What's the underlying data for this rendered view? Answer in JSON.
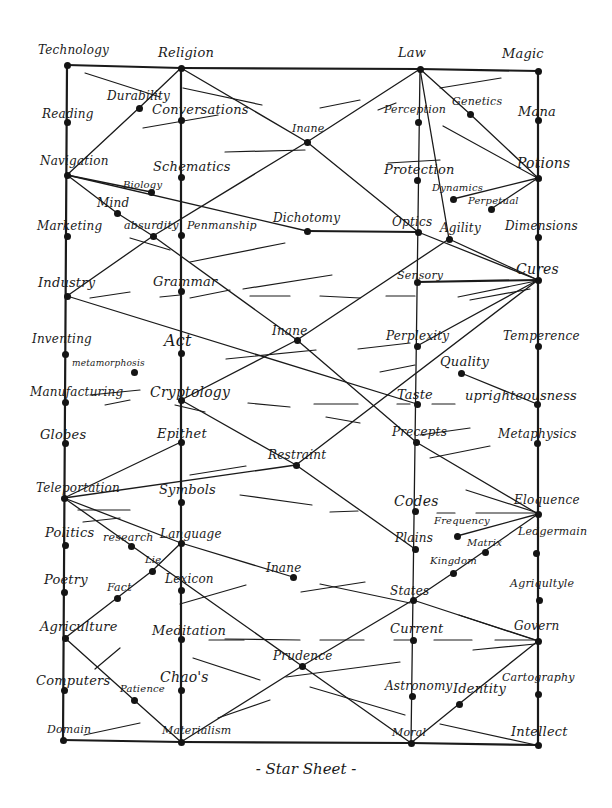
{
  "title": "- Star Sheet -",
  "colors": {
    "ink": "#1a1a1a",
    "paper": "#ffffff"
  },
  "columns": [
    {
      "id": "technology",
      "x": 67
    },
    {
      "id": "religion",
      "x": 181
    },
    {
      "id": "law",
      "x": 420
    },
    {
      "id": "magic",
      "x": 540
    }
  ],
  "nodes": [
    {
      "id": "technology",
      "label": "Technology",
      "x": 67,
      "y": 65,
      "lx": 38,
      "ly": 44,
      "fs": 12
    },
    {
      "id": "reading",
      "label": "Reading",
      "x": 67,
      "y": 122,
      "lx": 42,
      "ly": 108,
      "fs": 12
    },
    {
      "id": "navigation",
      "label": "Navigation",
      "x": 67,
      "y": 175,
      "lx": 40,
      "ly": 155,
      "fs": 12
    },
    {
      "id": "marketing",
      "label": "Marketing",
      "x": 67,
      "y": 236,
      "lx": 37,
      "ly": 220,
      "fs": 12
    },
    {
      "id": "industry",
      "label": "Industry",
      "x": 67,
      "y": 296,
      "lx": 38,
      "ly": 276,
      "fs": 13
    },
    {
      "id": "inventing",
      "label": "Inventing",
      "x": 65,
      "y": 354,
      "lx": 32,
      "ly": 333,
      "fs": 12
    },
    {
      "id": "manufacturing",
      "label": "Manufacturing",
      "x": 65,
      "y": 402,
      "lx": 30,
      "ly": 386,
      "fs": 12
    },
    {
      "id": "globes",
      "label": "Globes",
      "x": 65,
      "y": 443,
      "lx": 40,
      "ly": 428,
      "fs": 13
    },
    {
      "id": "teleportation",
      "label": "Teleportation",
      "x": 64,
      "y": 498,
      "lx": 36,
      "ly": 482,
      "fs": 12
    },
    {
      "id": "politics",
      "label": "Politics",
      "x": 65,
      "y": 545,
      "lx": 45,
      "ly": 526,
      "fs": 13
    },
    {
      "id": "poetry",
      "label": "Poetry",
      "x": 64,
      "y": 592,
      "lx": 44,
      "ly": 573,
      "fs": 13
    },
    {
      "id": "agriculture-left",
      "label": "Agriculture",
      "x": 65,
      "y": 638,
      "lx": 40,
      "ly": 620,
      "fs": 13
    },
    {
      "id": "computers",
      "label": "Computers",
      "x": 64,
      "y": 690,
      "lx": 36,
      "ly": 674,
      "fs": 13
    },
    {
      "id": "domain",
      "label": "Domain",
      "x": 63,
      "y": 740,
      "lx": 47,
      "ly": 724,
      "fs": 11
    },
    {
      "id": "religion",
      "label": "Religion",
      "x": 181,
      "y": 68,
      "lx": 158,
      "ly": 46,
      "fs": 13
    },
    {
      "id": "conversations",
      "label": "Conversations",
      "x": 181,
      "y": 120,
      "lx": 152,
      "ly": 103,
      "fs": 13
    },
    {
      "id": "schematics",
      "label": "Schematics",
      "x": 181,
      "y": 177,
      "lx": 153,
      "ly": 160,
      "fs": 13
    },
    {
      "id": "penmanship",
      "label": "Penmanship",
      "x": 181,
      "y": 235,
      "lx": 187,
      "ly": 220,
      "fs": 11
    },
    {
      "id": "grammar",
      "label": "Grammar",
      "x": 181,
      "y": 291,
      "lx": 153,
      "ly": 275,
      "fs": 13
    },
    {
      "id": "act",
      "label": "Act",
      "x": 181,
      "y": 353,
      "lx": 164,
      "ly": 333,
      "fs": 16
    },
    {
      "id": "cryptology",
      "label": "Cryptology",
      "x": 181,
      "y": 400,
      "lx": 150,
      "ly": 385,
      "fs": 14
    },
    {
      "id": "epithet",
      "label": "Epithet",
      "x": 181,
      "y": 442,
      "lx": 157,
      "ly": 427,
      "fs": 13
    },
    {
      "id": "symbols",
      "label": "Symbols",
      "x": 181,
      "y": 502,
      "lx": 159,
      "ly": 483,
      "fs": 13
    },
    {
      "id": "language",
      "label": "Language",
      "x": 181,
      "y": 543,
      "lx": 160,
      "ly": 528,
      "fs": 12
    },
    {
      "id": "lexicon",
      "label": "Lexicon",
      "x": 181,
      "y": 590,
      "lx": 165,
      "ly": 573,
      "fs": 12
    },
    {
      "id": "meditation",
      "label": "Meditation",
      "x": 181,
      "y": 639,
      "lx": 152,
      "ly": 624,
      "fs": 13
    },
    {
      "id": "chaos",
      "label": "Chao's",
      "x": 181,
      "y": 690,
      "lx": 160,
      "ly": 670,
      "fs": 14
    },
    {
      "id": "materialism",
      "label": "Materialism",
      "x": 181,
      "y": 742,
      "lx": 162,
      "ly": 725,
      "fs": 11
    },
    {
      "id": "law",
      "label": "Law",
      "x": 420,
      "y": 69,
      "lx": 398,
      "ly": 46,
      "fs": 13
    },
    {
      "id": "perception",
      "label": "Perception",
      "x": 418,
      "y": 122,
      "lx": 384,
      "ly": 104,
      "fs": 11
    },
    {
      "id": "protection",
      "label": "Protection",
      "x": 417,
      "y": 180,
      "lx": 384,
      "ly": 163,
      "fs": 13
    },
    {
      "id": "optics",
      "label": "Optics",
      "x": 418,
      "y": 232,
      "lx": 392,
      "ly": 216,
      "fs": 12
    },
    {
      "id": "sensory",
      "label": "Sensory",
      "x": 417,
      "y": 282,
      "lx": 397,
      "ly": 270,
      "fs": 11
    },
    {
      "id": "perplexity",
      "label": "Perplexity",
      "x": 417,
      "y": 346,
      "lx": 386,
      "ly": 330,
      "fs": 12
    },
    {
      "id": "taste",
      "label": "Taste",
      "x": 417,
      "y": 404,
      "lx": 397,
      "ly": 388,
      "fs": 13
    },
    {
      "id": "precepts",
      "label": "Precepts",
      "x": 416,
      "y": 442,
      "lx": 392,
      "ly": 426,
      "fs": 12
    },
    {
      "id": "codes",
      "label": "Codes",
      "x": 415,
      "y": 511,
      "lx": 394,
      "ly": 494,
      "fs": 14
    },
    {
      "id": "plains",
      "label": "Plains",
      "x": 415,
      "y": 549,
      "lx": 395,
      "ly": 532,
      "fs": 12
    },
    {
      "id": "states",
      "label": "States",
      "x": 413,
      "y": 600,
      "lx": 390,
      "ly": 585,
      "fs": 12
    },
    {
      "id": "current",
      "label": "Current",
      "x": 413,
      "y": 640,
      "lx": 390,
      "ly": 622,
      "fs": 13
    },
    {
      "id": "astronomy",
      "label": "Astronomy",
      "x": 412,
      "y": 696,
      "lx": 385,
      "ly": 680,
      "fs": 12
    },
    {
      "id": "moral",
      "label": "Moral",
      "x": 411,
      "y": 743,
      "lx": 392,
      "ly": 727,
      "fs": 11
    },
    {
      "id": "magic",
      "label": "Magic",
      "x": 538,
      "y": 71,
      "lx": 502,
      "ly": 47,
      "fs": 13
    },
    {
      "id": "mana",
      "label": "Mana",
      "x": 538,
      "y": 120,
      "lx": 518,
      "ly": 105,
      "fs": 13
    },
    {
      "id": "potions",
      "label": "Potions",
      "x": 538,
      "y": 178,
      "lx": 517,
      "ly": 156,
      "fs": 14
    },
    {
      "id": "dimensions",
      "label": "Dimensions",
      "x": 538,
      "y": 237,
      "lx": 505,
      "ly": 220,
      "fs": 12
    },
    {
      "id": "cures",
      "label": "Cures",
      "x": 538,
      "y": 280,
      "lx": 516,
      "ly": 262,
      "fs": 14
    },
    {
      "id": "temperence",
      "label": "Temperence",
      "x": 538,
      "y": 346,
      "lx": 503,
      "ly": 330,
      "fs": 12
    },
    {
      "id": "uprighteousness",
      "label": "uprighteousness",
      "x": 537,
      "y": 404,
      "lx": 465,
      "ly": 389,
      "fs": 13
    },
    {
      "id": "metaphysics",
      "label": "Metaphysics",
      "x": 537,
      "y": 443,
      "lx": 498,
      "ly": 428,
      "fs": 12
    },
    {
      "id": "eloquence",
      "label": "Eloquence",
      "x": 538,
      "y": 514,
      "lx": 514,
      "ly": 494,
      "fs": 12
    },
    {
      "id": "ledgermain",
      "label": "Ledgermain",
      "x": 536,
      "y": 553,
      "lx": 518,
      "ly": 526,
      "fs": 11
    },
    {
      "id": "agriculture-right",
      "label": "Agriqultyle",
      "x": 539,
      "y": 600,
      "lx": 510,
      "ly": 578,
      "fs": 11
    },
    {
      "id": "govern",
      "label": "Govern",
      "x": 538,
      "y": 641,
      "lx": 514,
      "ly": 620,
      "fs": 12
    },
    {
      "id": "cartography",
      "label": "Cartography",
      "x": 538,
      "y": 694,
      "lx": 502,
      "ly": 672,
      "fs": 11
    },
    {
      "id": "intellect",
      "label": "Intellect",
      "x": 538,
      "y": 745,
      "lx": 511,
      "ly": 725,
      "fs": 13
    },
    {
      "id": "durability",
      "label": "Durability",
      "x": 139,
      "y": 108,
      "lx": 107,
      "ly": 90,
      "fs": 12
    },
    {
      "id": "biology",
      "label": "Biology",
      "x": 151,
      "y": 192,
      "lx": 123,
      "ly": 180,
      "fs": 10
    },
    {
      "id": "mind",
      "label": "Mind",
      "x": 117,
      "y": 213,
      "lx": 97,
      "ly": 197,
      "fs": 12
    },
    {
      "id": "absurdity",
      "label": "absurdity",
      "x": 153,
      "y": 236,
      "lx": 124,
      "ly": 220,
      "fs": 11
    },
    {
      "id": "metamorphosis",
      "label": "metamorphosis",
      "x": 134,
      "y": 372,
      "lx": 72,
      "ly": 359,
      "fs": 9
    },
    {
      "id": "research",
      "label": "research",
      "x": 131,
      "y": 546,
      "lx": 103,
      "ly": 532,
      "fs": 11
    },
    {
      "id": "lie",
      "label": "Lie",
      "x": 152,
      "y": 571,
      "lx": 145,
      "ly": 555,
      "fs": 10
    },
    {
      "id": "fact",
      "label": "Fact",
      "x": 117,
      "y": 598,
      "lx": 107,
      "ly": 582,
      "fs": 11
    },
    {
      "id": "patience",
      "label": "Patience",
      "x": 134,
      "y": 700,
      "lx": 120,
      "ly": 684,
      "fs": 10
    },
    {
      "id": "inane-top",
      "label": "Inane",
      "x": 307,
      "y": 142,
      "lx": 292,
      "ly": 123,
      "fs": 11
    },
    {
      "id": "dichotomy",
      "label": "Dichotomy",
      "x": 307,
      "y": 231,
      "lx": 273,
      "ly": 212,
      "fs": 12
    },
    {
      "id": "inane-mid",
      "label": "Inane",
      "x": 297,
      "y": 340,
      "lx": 272,
      "ly": 325,
      "fs": 12
    },
    {
      "id": "restraint",
      "label": "Restraint",
      "x": 296,
      "y": 465,
      "lx": 268,
      "ly": 449,
      "fs": 12
    },
    {
      "id": "inane-low",
      "label": "Inane",
      "x": 293,
      "y": 577,
      "lx": 266,
      "ly": 562,
      "fs": 12
    },
    {
      "id": "prudence",
      "label": "Prudence",
      "x": 302,
      "y": 666,
      "lx": 273,
      "ly": 650,
      "fs": 12
    },
    {
      "id": "genetics",
      "label": "Genetics",
      "x": 470,
      "y": 114,
      "lx": 452,
      "ly": 96,
      "fs": 11
    },
    {
      "id": "dynamics",
      "label": "Dynamics",
      "x": 453,
      "y": 199,
      "lx": 432,
      "ly": 183,
      "fs": 10
    },
    {
      "id": "perpetual",
      "label": "Perpetual",
      "x": 491,
      "y": 209,
      "lx": 468,
      "ly": 196,
      "fs": 10
    },
    {
      "id": "agility",
      "label": "Agility",
      "x": 449,
      "y": 239,
      "lx": 440,
      "ly": 222,
      "fs": 12
    },
    {
      "id": "quality",
      "label": "Quality",
      "x": 461,
      "y": 373,
      "lx": 440,
      "ly": 355,
      "fs": 13
    },
    {
      "id": "frequency",
      "label": "Frequency",
      "x": 457,
      "y": 536,
      "lx": 434,
      "ly": 516,
      "fs": 10
    },
    {
      "id": "matrix",
      "label": "Matrix",
      "x": 485,
      "y": 552,
      "lx": 467,
      "ly": 538,
      "fs": 10
    },
    {
      "id": "kingdom",
      "label": "Kingdom",
      "x": 453,
      "y": 573,
      "lx": 430,
      "ly": 556,
      "fs": 10
    },
    {
      "id": "identity",
      "label": "Identity",
      "x": 459,
      "y": 704,
      "lx": 453,
      "ly": 682,
      "fs": 13
    }
  ],
  "edges": [
    [
      "technology",
      "religion"
    ],
    [
      "religion",
      "law"
    ],
    [
      "law",
      "magic"
    ],
    [
      "domain",
      "materialism"
    ],
    [
      "materialism",
      "moral"
    ],
    [
      "moral",
      "intellect"
    ],
    [
      "technology",
      "domain"
    ],
    [
      "religion",
      "materialism"
    ],
    [
      "law",
      "moral"
    ],
    [
      "magic",
      "intellect"
    ],
    [
      "religion",
      "inane-top"
    ],
    [
      "inane-top",
      "optics"
    ],
    [
      "law",
      "inane-top"
    ],
    [
      "inane-top",
      "absurdity"
    ],
    [
      "law",
      "genetics"
    ],
    [
      "genetics",
      "potions"
    ],
    [
      "religion",
      "durability"
    ],
    [
      "durability",
      "navigation"
    ],
    [
      "navigation",
      "biology"
    ],
    [
      "navigation",
      "mind"
    ],
    [
      "mind",
      "absurdity"
    ],
    [
      "absurdity",
      "industry"
    ],
    [
      "absurdity",
      "inane-mid"
    ],
    [
      "inane-mid",
      "agility"
    ],
    [
      "agility",
      "law"
    ],
    [
      "optics",
      "cures"
    ],
    [
      "agility",
      "cures"
    ],
    [
      "industry",
      "taste"
    ],
    [
      "inane-mid",
      "cryptology"
    ],
    [
      "inane-mid",
      "precepts"
    ],
    [
      "cures",
      "restraint"
    ],
    [
      "restraint",
      "teleportation"
    ],
    [
      "cryptology",
      "restraint"
    ],
    [
      "restraint",
      "plains"
    ],
    [
      "teleportation",
      "language"
    ],
    [
      "epithet",
      "teleportation"
    ],
    [
      "teleportation",
      "prudence"
    ],
    [
      "language",
      "inane-low"
    ],
    [
      "prudence",
      "states"
    ],
    [
      "prudence",
      "moral"
    ],
    [
      "agriculture-left",
      "lie"
    ],
    [
      "lie",
      "language"
    ],
    [
      "agriculture-left",
      "patience"
    ],
    [
      "patience",
      "materialism"
    ],
    [
      "materialism",
      "prudence"
    ],
    [
      "eloquence",
      "kingdom"
    ],
    [
      "kingdom",
      "states"
    ],
    [
      "precepts",
      "eloquence"
    ],
    [
      "quality",
      "uprighteousness"
    ],
    [
      "govern",
      "identity"
    ],
    [
      "identity",
      "moral"
    ],
    [
      "states",
      "govern"
    ],
    [
      "eloquence",
      "frequency"
    ],
    [
      "dynamics",
      "potions"
    ],
    [
      "perpetual",
      "potions"
    ],
    [
      "navigation",
      "dichotomy"
    ],
    [
      "dichotomy",
      "optics"
    ],
    [
      "sensory",
      "cures"
    ],
    [
      "perplexity",
      "cures"
    ]
  ],
  "strokes": [
    [
      85,
      73,
      160,
      97
    ],
    [
      183,
      88,
      262,
      105
    ],
    [
      143,
      128,
      218,
      115
    ],
    [
      225,
      152,
      305,
      150
    ],
    [
      320,
      108,
      360,
      100
    ],
    [
      378,
      110,
      396,
      103
    ],
    [
      440,
      88,
      501,
      78
    ],
    [
      388,
      163,
      440,
      160
    ],
    [
      443,
      126,
      541,
      180
    ],
    [
      130,
      238,
      170,
      250
    ],
    [
      190,
      262,
      285,
      243
    ],
    [
      243,
      289,
      332,
      275
    ],
    [
      90,
      298,
      130,
      292
    ],
    [
      160,
      297,
      180,
      295
    ],
    [
      190,
      298,
      230,
      290
    ],
    [
      250,
      296,
      290,
      296
    ],
    [
      248,
      403,
      290,
      407
    ],
    [
      314,
      404,
      358,
      404
    ],
    [
      397,
      404,
      410,
      404
    ],
    [
      432,
      404,
      455,
      404
    ],
    [
      105,
      405,
      130,
      400
    ],
    [
      90,
      395,
      140,
      390
    ],
    [
      175,
      405,
      205,
      412
    ],
    [
      326,
      417,
      360,
      423
    ],
    [
      320,
      296,
      360,
      298
    ],
    [
      386,
      296,
      415,
      296
    ],
    [
      458,
      297,
      536,
      281
    ],
    [
      470,
      300,
      530,
      289
    ],
    [
      226,
      359,
      316,
      350
    ],
    [
      358,
      349,
      410,
      343
    ],
    [
      380,
      372,
      415,
      365
    ],
    [
      190,
      475,
      246,
      466
    ],
    [
      420,
      435,
      470,
      428
    ],
    [
      430,
      458,
      490,
      446
    ],
    [
      240,
      495,
      312,
      505
    ],
    [
      330,
      512,
      358,
      511
    ],
    [
      437,
      513,
      455,
      513
    ],
    [
      476,
      513,
      535,
      513
    ],
    [
      466,
      490,
      538,
      513
    ],
    [
      83,
      522,
      120,
      518
    ],
    [
      78,
      510,
      130,
      510
    ],
    [
      180,
      604,
      246,
      585
    ],
    [
      301,
      592,
      365,
      582
    ],
    [
      320,
      584,
      410,
      603
    ],
    [
      320,
      640,
      364,
      640
    ],
    [
      209,
      640,
      244,
      640
    ],
    [
      394,
      640,
      414,
      640
    ],
    [
      434,
      640,
      472,
      640
    ],
    [
      495,
      640,
      536,
      640
    ],
    [
      459,
      615,
      536,
      640
    ],
    [
      473,
      650,
      535,
      644
    ],
    [
      193,
      658,
      260,
      680
    ],
    [
      286,
      677,
      400,
      662
    ],
    [
      310,
      687,
      405,
      715
    ],
    [
      95,
      669,
      120,
      648
    ],
    [
      84,
      735,
      140,
      723
    ],
    [
      218,
      718,
      270,
      700
    ],
    [
      440,
      724,
      536,
      745
    ],
    [
      225,
      639,
      300,
      640
    ]
  ]
}
